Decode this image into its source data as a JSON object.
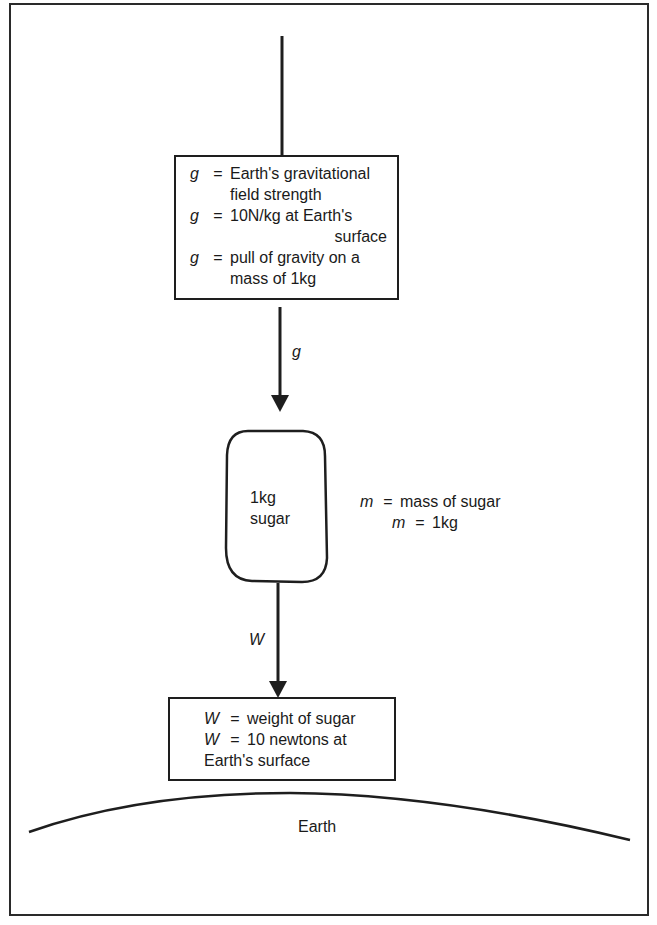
{
  "diagram": {
    "top_box": {
      "lines": [
        {
          "symbol": "g",
          "eq": "=",
          "text": "Earth's gravitational"
        },
        {
          "continuation": "field strength"
        },
        {
          "symbol": "g",
          "eq": "=",
          "text": "10N/kg at Earth's"
        },
        {
          "continuation_right": "surface"
        },
        {
          "symbol": "g",
          "eq": "=",
          "text": "pull of gravity on a"
        },
        {
          "continuation": "mass of 1kg"
        }
      ]
    },
    "arrow_g": {
      "label": "g"
    },
    "sugar_bag": {
      "line1": "1kg",
      "line2": "sugar"
    },
    "mass_note": {
      "line1": {
        "symbol": "m",
        "eq": "=",
        "text": "mass of sugar"
      },
      "line2": {
        "symbol": "m",
        "eq": "=",
        "text": "1kg"
      }
    },
    "arrow_w": {
      "label": "W"
    },
    "bottom_box": {
      "line1": {
        "symbol": "W",
        "eq": "=",
        "text": "weight of sugar"
      },
      "line2": {
        "symbol": "W",
        "eq": "=",
        "text": "10 newtons at"
      },
      "line3": "Earth's surface"
    },
    "earth": {
      "label": "Earth"
    },
    "colors": {
      "stroke": "#1e1e1e",
      "background": "#ffffff"
    }
  }
}
